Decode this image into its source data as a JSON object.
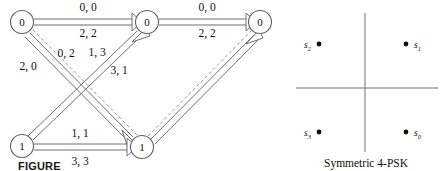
{
  "figure": {
    "caption_partial": "FIGURE",
    "psk_caption": "Symmetric 4-PSK"
  },
  "trellis": {
    "nodes": [
      {
        "id": "n-top-left",
        "label": "0",
        "cx": 22,
        "cy": 22
      },
      {
        "id": "n-top-mid",
        "label": "0",
        "cx": 147,
        "cy": 22
      },
      {
        "id": "n-top-right",
        "label": "0",
        "cx": 260,
        "cy": 22
      },
      {
        "id": "n-bot-left",
        "label": "1",
        "cx": 22,
        "cy": 146
      },
      {
        "id": "n-bot-right",
        "label": "1",
        "cx": 142,
        "cy": 147
      }
    ],
    "edge_labels": [
      {
        "id": "lab-top-left-upper",
        "text": "0, 0",
        "x": 88,
        "y": 11
      },
      {
        "id": "lab-top-left-lower",
        "text": "2, 2",
        "x": 88,
        "y": 36
      },
      {
        "id": "lab-top-right-upper",
        "text": "0, 0",
        "x": 207,
        "y": 11
      },
      {
        "id": "lab-top-right-lower",
        "text": "2, 2",
        "x": 207,
        "y": 36
      },
      {
        "id": "lab-diag-2-0",
        "text": "2, 0",
        "x": 28,
        "y": 68
      },
      {
        "id": "lab-diag-0-2",
        "text": "0, 2",
        "x": 65,
        "y": 54
      },
      {
        "id": "lab-diag-1-3",
        "text": "1, 3",
        "x": 96,
        "y": 54
      },
      {
        "id": "lab-diag-3-1",
        "text": "3, 1",
        "x": 118,
        "y": 72
      },
      {
        "id": "lab-bot-upper",
        "text": "1, 1",
        "x": 80,
        "y": 136
      },
      {
        "id": "lab-bot-lower",
        "text": "3, 3",
        "x": 80,
        "y": 163
      }
    ]
  },
  "psk": {
    "title": "Symmetric 4-PSK",
    "points": [
      {
        "id": "s0",
        "label": "s",
        "sub": "0",
        "px": 118,
        "py": 132,
        "label_side": "right"
      },
      {
        "id": "s1",
        "label": "s",
        "sub": "1",
        "px": 118,
        "py": 44,
        "label_side": "right"
      },
      {
        "id": "s2",
        "label": "s",
        "sub": "2",
        "px": 31,
        "py": 44,
        "label_side": "left"
      },
      {
        "id": "s3",
        "label": "s",
        "sub": "3",
        "px": 31,
        "py": 132,
        "label_side": "left"
      }
    ],
    "axes": {
      "cx": 77,
      "cy": 88,
      "x_min": 8,
      "x_max": 150,
      "y_min": 13,
      "y_max": 152
    }
  },
  "colors": {
    "ink": "#101010",
    "line": "#6f6f6f",
    "dash": "#8a8a8a",
    "page": "#ffffff"
  }
}
